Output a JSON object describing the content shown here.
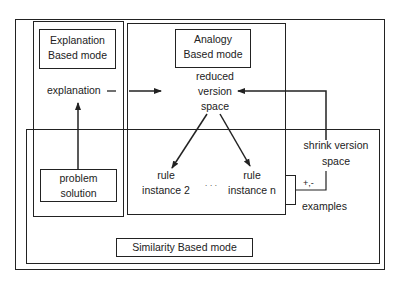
{
  "diagram": {
    "modes": {
      "explanation": {
        "line1": "Explanation",
        "line2": "Based mode"
      },
      "analogy": {
        "line1": "Analogy",
        "line2": "Based mode"
      },
      "similarity": {
        "label": "Similarity  Based mode"
      }
    },
    "nodes": {
      "explanation": "explanation",
      "reduced_version_space": {
        "line1": "reduced",
        "line2": "version",
        "line3": "space"
      },
      "problem_solution": {
        "line1": "problem",
        "line2": "solution"
      },
      "rule_instance_2": {
        "line1": "rule",
        "line2": "instance  2"
      },
      "ellipsis": "· · ·",
      "rule_instance_n": {
        "line1": "rule",
        "line2": "instance  n"
      },
      "shrink_version_space": {
        "line1": "shrink  version",
        "line2": "space"
      },
      "sign": "+,-",
      "examples": "examples"
    }
  }
}
